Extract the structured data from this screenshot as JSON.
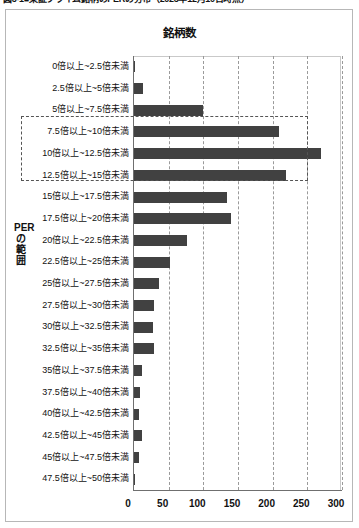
{
  "caption": "図3-1■東証プライム銘柄のPERの分布（2023年12月10日時点）",
  "chart": {
    "title": "銘柄数",
    "y_axis_title": "PERの範囲"
  },
  "chart_data": {
    "type": "bar",
    "orientation": "horizontal",
    "title": "銘柄数",
    "xlabel": "銘柄数",
    "ylabel": "PERの範囲",
    "xlim": [
      0,
      300
    ],
    "xticks": [
      "0",
      "50",
      "100",
      "150",
      "200",
      "250",
      "300"
    ],
    "xtick_values": [
      0,
      50,
      100,
      150,
      200,
      250,
      300
    ],
    "grid": "vertical-dashed",
    "legend": "none",
    "bar_color": "#414141",
    "categories": [
      "0倍以上~2.5倍未満",
      "2.5倍以上~5倍未満",
      "5倍以上~7.5倍未満",
      "7.5倍以上~10倍未満",
      "10倍以上~12.5倍未満",
      "12.5倍以上~15倍未満",
      "15倍以上~17.5倍未満",
      "17.5倍以上~20倍未満",
      "20倍以上~22.5倍未満",
      "22.5倍以上~25倍未満",
      "25倍以上~27.5倍未満",
      "27.5倍以上~30倍未満",
      "30倍以上~32.5倍未満",
      "32.5倍以上~35倍未満",
      "35倍以上~37.5倍未満",
      "37.5倍以上~40倍未満",
      "40倍以上~42.5倍未満",
      "42.5倍以上~45倍未満",
      "45倍以上~47.5倍未満",
      "47.5倍以上~50倍未満"
    ],
    "values": [
      1,
      13,
      100,
      209,
      270,
      219,
      134,
      140,
      76,
      52,
      36,
      29,
      28,
      29,
      11,
      9,
      7,
      12,
      7,
      2
    ],
    "annotations": [
      {
        "name": "highlight-box-peak-range",
        "type": "dashed-rectangle",
        "covers_categories": [
          "7.5倍以上~10倍未満",
          "10倍以上~12.5倍未満",
          "12.5倍以上~15倍未満"
        ]
      }
    ]
  }
}
